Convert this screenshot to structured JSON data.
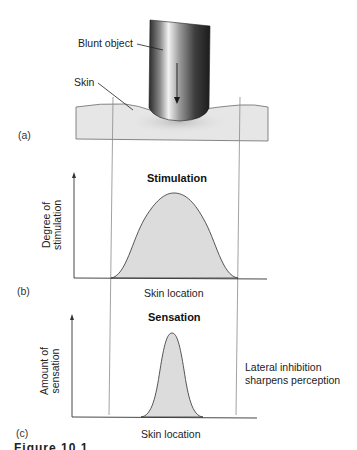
{
  "panel_a": {
    "tag": "(a)",
    "blunt_object_label": "Blunt object",
    "skin_label": "Skin"
  },
  "panel_b": {
    "tag": "(b)",
    "title": "Stimulation",
    "ylabel_line1": "Degree of",
    "ylabel_line2": "stimulation",
    "xlabel": "Skin location"
  },
  "panel_c": {
    "tag": "(c)",
    "title": "Sensation",
    "ylabel_line1": "Amount of",
    "ylabel_line2": "sensation",
    "xlabel": "Skin location",
    "note_line1": "Lateral inhibition",
    "note_line2": "sharpens perception"
  },
  "caption_fragment": "Figure 10.1",
  "colors": {
    "skin_fill": "#e6e6e6",
    "curve_fill": "#dcdcdc",
    "line": "#555555",
    "guide": "#8a8a8a"
  }
}
